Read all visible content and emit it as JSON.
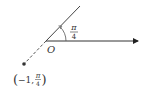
{
  "diagram": {
    "origin_label": "O",
    "angle_label": {
      "numerator": "π",
      "denominator": "4"
    },
    "point_label": {
      "open": "(",
      "r": "−1,",
      "theta_num": "π",
      "theta_den": "4",
      "close": ")"
    },
    "colors": {
      "line": "#333333",
      "background": "#ffffff"
    }
  }
}
